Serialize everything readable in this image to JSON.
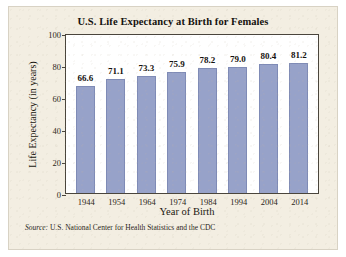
{
  "chart_data": {
    "type": "bar",
    "title": "U.S. Life Expectancy at Birth for Females",
    "xlabel": "Year of Birth",
    "ylabel": "Life Expectancy (in years)",
    "categories": [
      "1944",
      "1954",
      "1964",
      "1974",
      "1984",
      "1994",
      "2004",
      "2014"
    ],
    "values": [
      66.6,
      71.1,
      73.3,
      75.9,
      78.2,
      79.0,
      80.4,
      81.2
    ],
    "value_labels": [
      "66.6",
      "71.1",
      "73.3",
      "75.9",
      "78.2",
      "79.0",
      "80.4",
      "81.2"
    ],
    "ylim": [
      0,
      100
    ],
    "yticks": [
      0,
      20,
      40,
      60,
      80,
      100
    ],
    "ytick_labels": [
      "0",
      "20",
      "40",
      "60",
      "80",
      "100"
    ],
    "grid": false,
    "legend": "none",
    "bar_color": "#97a2c9",
    "bar_edge_color": "#7f8bb6",
    "plot_background": "#ffffff",
    "figure_background": "#f3eee2",
    "axis_color": "#4a453c"
  },
  "source": {
    "prefix": "Source:",
    "text": "U.S. National Center for Health Statistics and the CDC"
  }
}
